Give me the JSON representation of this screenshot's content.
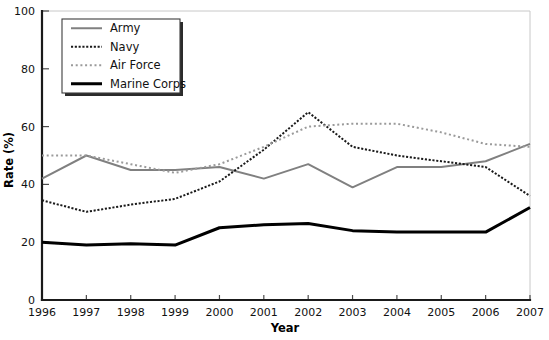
{
  "chart_data": {
    "type": "line",
    "title": "",
    "xlabel": "Year",
    "ylabel": "Rate (%)",
    "grid": false,
    "legend_position": "top-left",
    "xlim": [
      1996,
      2007
    ],
    "ylim": [
      0,
      100
    ],
    "x": [
      1996,
      1997,
      1998,
      1999,
      2000,
      2001,
      2002,
      2003,
      2004,
      2005,
      2006,
      2007
    ],
    "categories": [
      "1996",
      "1997",
      "1998",
      "1999",
      "2000",
      "2001",
      "2002",
      "2003",
      "2004",
      "2005",
      "2006",
      "2007"
    ],
    "xticks": [
      "1996",
      "1997",
      "1998",
      "1999",
      "2000",
      "2001",
      "2002",
      "2003",
      "2004",
      "2005",
      "2006",
      "2007"
    ],
    "yticks": [
      "0",
      "20",
      "40",
      "60",
      "80",
      "100"
    ],
    "ytick_values": [
      0,
      20,
      40,
      60,
      80,
      100
    ],
    "series": [
      {
        "name": "Army",
        "style": "solid",
        "color": "#808080",
        "width": 2.0,
        "values": [
          42,
          50,
          45,
          45,
          46,
          42,
          47,
          39,
          46,
          46,
          48,
          54
        ]
      },
      {
        "name": "Navy",
        "style": "dotted",
        "color": "#1a1a1a",
        "width": 2.0,
        "values": [
          34.5,
          30.5,
          33,
          35,
          41,
          52,
          65,
          53,
          50,
          48,
          46,
          36
        ]
      },
      {
        "name": "Air Force",
        "style": "dotted-light",
        "color": "#9a9a9a",
        "width": 2.0,
        "values": [
          50,
          50,
          47,
          44,
          47,
          53,
          60,
          61,
          61,
          58,
          54,
          53
        ]
      },
      {
        "name": "Marine Corps",
        "style": "solid-thick",
        "color": "#000000",
        "width": 3.0,
        "values": [
          20,
          19,
          19.5,
          19,
          25,
          26,
          26.5,
          24,
          23.5,
          23.5,
          23.5,
          32
        ]
      }
    ]
  },
  "legend": {
    "entries": [
      {
        "label": "Army"
      },
      {
        "label": "Navy"
      },
      {
        "label": "Air Force"
      },
      {
        "label": "Marine Corps"
      }
    ]
  }
}
